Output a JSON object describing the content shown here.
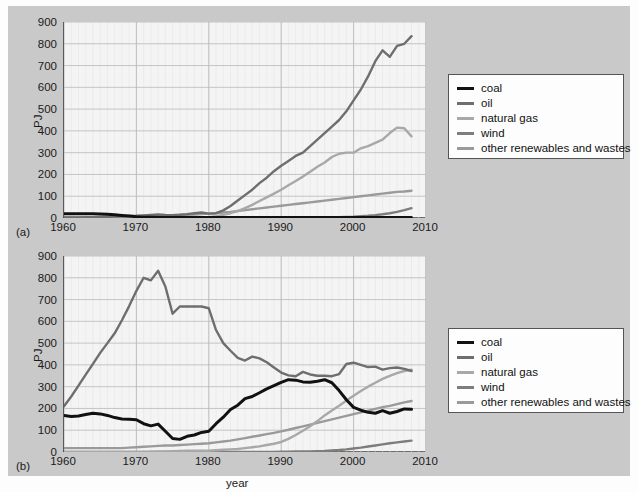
{
  "figure": {
    "background_color": "#c9c9c9",
    "plot_background_color": "#f4f4f4",
    "axis_color": "#3a3a3a",
    "grid_color": "#b9b9b9"
  },
  "series_styles": [
    {
      "key": "coal",
      "label": "coal",
      "color": "#111111",
      "width": 3.0
    },
    {
      "key": "oil",
      "label": "oil",
      "color": "#6e6e6e",
      "width": 2.4
    },
    {
      "key": "natural_gas",
      "label": "natural gas",
      "color": "#a8a8a8",
      "width": 2.4
    },
    {
      "key": "wind",
      "label": "wind",
      "color": "#7d7d7d",
      "width": 2.4
    },
    {
      "key": "other_renewables",
      "label": "other renewables and wastes",
      "color": "#9a9a9a",
      "width": 2.4
    }
  ],
  "legend": {
    "items": [
      {
        "label": "coal"
      },
      {
        "label": "oil"
      },
      {
        "label": "natural gas"
      },
      {
        "label": "wind"
      },
      {
        "label": "other renewables and wastes"
      }
    ]
  },
  "panel_a": {
    "label": "(a)",
    "ylabel": "PJ",
    "xlabel": "",
    "yticks": [
      "0",
      "100",
      "200",
      "300",
      "400",
      "500",
      "600",
      "700",
      "800",
      "900"
    ],
    "xticks": [
      "1960",
      "1970",
      "1980",
      "1990",
      "2000",
      "2010"
    ]
  },
  "panel_b": {
    "label": "(b)",
    "ylabel": "PJ",
    "xlabel": "year",
    "yticks": [
      "0",
      "100",
      "200",
      "300",
      "400",
      "500",
      "600",
      "700",
      "800",
      "900"
    ],
    "xticks": [
      "1960",
      "1970",
      "1980",
      "1990",
      "2000",
      "2010"
    ]
  },
  "chart_data": [
    {
      "type": "line",
      "panel": "(a)",
      "title": "",
      "xlabel": "",
      "ylabel": "PJ",
      "xlim": [
        1960,
        2010
      ],
      "ylim": [
        0,
        900
      ],
      "ytick_step": 100,
      "xtick_step": 10,
      "grid": true,
      "legend_position": "right",
      "x": [
        1960,
        1961,
        1962,
        1963,
        1964,
        1965,
        1966,
        1967,
        1968,
        1969,
        1970,
        1971,
        1972,
        1973,
        1974,
        1975,
        1976,
        1977,
        1978,
        1979,
        1980,
        1981,
        1982,
        1983,
        1984,
        1985,
        1986,
        1987,
        1988,
        1989,
        1990,
        1991,
        1992,
        1993,
        1994,
        1995,
        1996,
        1997,
        1998,
        1999,
        2000,
        2001,
        2002,
        2003,
        2004,
        2005,
        2006,
        2007,
        2008
      ],
      "series": [
        {
          "name": "coal",
          "values": [
            20,
            20,
            20,
            20,
            19,
            18,
            17,
            15,
            12,
            9,
            6,
            4,
            3,
            2,
            2,
            2,
            2,
            2,
            2,
            2,
            2,
            2,
            2,
            2,
            2,
            2,
            2,
            2,
            2,
            2,
            2,
            2,
            2,
            2,
            2,
            2,
            2,
            2,
            2,
            2,
            2,
            2,
            2,
            2,
            2,
            2,
            2,
            2,
            2
          ]
        },
        {
          "name": "oil",
          "values": [
            3,
            3,
            3,
            4,
            4,
            5,
            6,
            7,
            8,
            9,
            10,
            12,
            14,
            16,
            14,
            13,
            15,
            18,
            22,
            25,
            20,
            22,
            35,
            55,
            80,
            105,
            130,
            160,
            185,
            215,
            240,
            262,
            285,
            300,
            330,
            360,
            390,
            420,
            450,
            490,
            540,
            590,
            650,
            720,
            770,
            740,
            790,
            800,
            835
          ]
        },
        {
          "name": "natural gas",
          "values": [
            0,
            0,
            0,
            0,
            0,
            0,
            0,
            0,
            0,
            0,
            0,
            0,
            0,
            0,
            0,
            0,
            0,
            0,
            1,
            2,
            4,
            8,
            14,
            22,
            32,
            45,
            60,
            78,
            95,
            112,
            130,
            150,
            170,
            190,
            212,
            235,
            255,
            280,
            295,
            300,
            300,
            320,
            330,
            345,
            360,
            390,
            415,
            412,
            375
          ]
        },
        {
          "name": "wind",
          "values": [
            0,
            0,
            0,
            0,
            0,
            0,
            0,
            0,
            0,
            0,
            0,
            0,
            0,
            0,
            0,
            0,
            0,
            0,
            0,
            0,
            0,
            0,
            0,
            0,
            0,
            0,
            0,
            0,
            0,
            0,
            0,
            0,
            0,
            1,
            1,
            2,
            2,
            3,
            4,
            5,
            6,
            8,
            10,
            13,
            17,
            22,
            28,
            36,
            45
          ]
        },
        {
          "name": "other renewables and wastes",
          "values": [
            2,
            2,
            2,
            2,
            2,
            3,
            4,
            5,
            6,
            7,
            8,
            9,
            10,
            11,
            12,
            13,
            14,
            15,
            16,
            18,
            20,
            22,
            25,
            28,
            32,
            36,
            40,
            44,
            48,
            52,
            56,
            60,
            64,
            68,
            72,
            76,
            80,
            84,
            88,
            92,
            96,
            100,
            104,
            108,
            112,
            116,
            120,
            122,
            125
          ]
        }
      ]
    },
    {
      "type": "line",
      "panel": "(b)",
      "title": "",
      "xlabel": "year",
      "ylabel": "PJ",
      "xlim": [
        1960,
        2010
      ],
      "ylim": [
        0,
        900
      ],
      "ytick_step": 100,
      "xtick_step": 10,
      "grid": true,
      "legend_position": "right",
      "x": [
        1960,
        1961,
        1962,
        1963,
        1964,
        1965,
        1966,
        1967,
        1968,
        1969,
        1970,
        1971,
        1972,
        1973,
        1974,
        1975,
        1976,
        1977,
        1978,
        1979,
        1980,
        1981,
        1982,
        1983,
        1984,
        1985,
        1986,
        1987,
        1988,
        1989,
        1990,
        1991,
        1992,
        1993,
        1994,
        1995,
        1996,
        1997,
        1998,
        1999,
        2000,
        2001,
        2002,
        2003,
        2004,
        2005,
        2006,
        2007,
        2008
      ],
      "series": [
        {
          "name": "coal",
          "values": [
            168,
            163,
            165,
            172,
            178,
            175,
            168,
            158,
            152,
            150,
            148,
            130,
            120,
            128,
            95,
            62,
            58,
            72,
            78,
            90,
            95,
            130,
            160,
            195,
            215,
            245,
            255,
            272,
            290,
            305,
            320,
            332,
            330,
            322,
            320,
            325,
            332,
            318,
            282,
            240,
            205,
            192,
            182,
            178,
            190,
            178,
            186,
            198,
            196
          ]
        },
        {
          "name": "oil",
          "values": [
            210,
            255,
            305,
            355,
            405,
            455,
            500,
            545,
            605,
            670,
            740,
            800,
            788,
            832,
            760,
            635,
            668,
            668,
            668,
            668,
            660,
            560,
            500,
            465,
            432,
            420,
            438,
            430,
            412,
            388,
            365,
            352,
            348,
            368,
            356,
            350,
            350,
            348,
            358,
            404,
            410,
            400,
            390,
            392,
            378,
            385,
            388,
            382,
            372
          ]
        },
        {
          "name": "natural gas",
          "values": [
            0,
            0,
            0,
            0,
            0,
            0,
            0,
            0,
            0,
            0,
            0,
            0,
            1,
            2,
            3,
            4,
            5,
            6,
            6,
            6,
            6,
            8,
            10,
            12,
            14,
            18,
            22,
            26,
            32,
            38,
            46,
            60,
            78,
            98,
            118,
            142,
            168,
            190,
            212,
            236,
            258,
            280,
            300,
            318,
            336,
            350,
            362,
            372,
            378
          ]
        },
        {
          "name": "wind",
          "values": [
            0,
            0,
            0,
            0,
            0,
            0,
            0,
            0,
            0,
            0,
            0,
            0,
            0,
            0,
            0,
            0,
            0,
            0,
            0,
            0,
            0,
            0,
            0,
            0,
            0,
            0,
            0,
            0,
            0,
            0,
            1,
            1,
            2,
            2,
            3,
            4,
            5,
            7,
            9,
            12,
            16,
            20,
            25,
            30,
            35,
            40,
            44,
            48,
            52
          ]
        },
        {
          "name": "other renewables and wastes",
          "values": [
            18,
            18,
            18,
            18,
            18,
            18,
            18,
            18,
            18,
            20,
            22,
            24,
            26,
            28,
            30,
            30,
            32,
            34,
            36,
            38,
            40,
            44,
            48,
            52,
            58,
            64,
            70,
            76,
            82,
            88,
            95,
            102,
            110,
            118,
            126,
            134,
            142,
            150,
            158,
            166,
            174,
            182,
            190,
            198,
            206,
            212,
            220,
            228,
            234
          ]
        }
      ]
    }
  ]
}
